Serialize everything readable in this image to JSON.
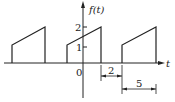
{
  "figure": {
    "type": "periodic-waveform",
    "y_axis_label": "f(t)",
    "x_axis_label": "t",
    "origin_label": "0",
    "y_ticks": [
      {
        "label": "1",
        "value": 1
      },
      {
        "label": "2",
        "value": 2
      }
    ],
    "dimensions": [
      {
        "label": "2",
        "meaning": "pulse gap / offset"
      },
      {
        "label": "5",
        "meaning": "period"
      }
    ],
    "pulses": [
      {
        "index": 0,
        "start_value": 1,
        "end_value": 2
      },
      {
        "index": 1,
        "start_value": 1,
        "end_value": 2
      },
      {
        "index": 2,
        "start_value": 1,
        "end_value": 2
      }
    ],
    "line_color": "#222222"
  }
}
